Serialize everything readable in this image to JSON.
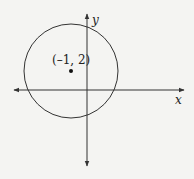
{
  "diagram": {
    "axes": {
      "x_label": "x",
      "y_label": "y"
    },
    "center_point": {
      "label": "(–1, 2)",
      "x": -1,
      "y": 2
    },
    "colors": {
      "stroke": "#333333",
      "background": "#f4f4f2"
    }
  }
}
